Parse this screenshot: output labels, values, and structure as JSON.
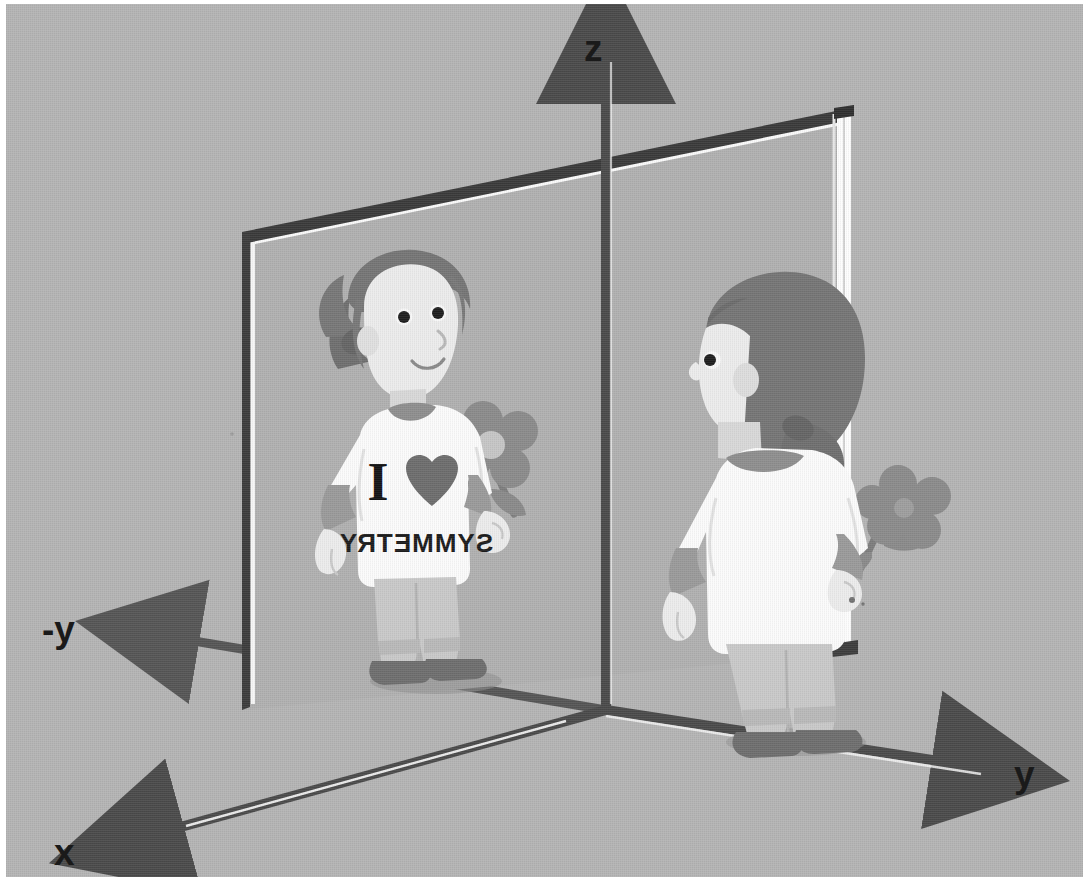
{
  "figure": {
    "background_color": "#b4b4b4",
    "border_color": "#ffffff"
  },
  "axes": {
    "color": "#4a4a4a",
    "labels": {
      "z": "z",
      "y": "y",
      "neg_y": "-y",
      "x": "x"
    },
    "label_color": "#1a1a1a"
  },
  "mirror": {
    "name": "reflection-plane",
    "frame_color": "#3c3c3c",
    "edge_highlight_color": "#fdfdfd",
    "surface_color": "#b0b0b0"
  },
  "mirror_image_figure": {
    "name": "reflected-girl",
    "shirt_text_line1": "I",
    "shirt_text_line2": "SYMMETRY",
    "shirt_heart": "heart",
    "shirt_color": "#fdfdfd",
    "hair_color": "#7a7a7a",
    "skin_color": "#e8e8e8",
    "pants_color": "#c9c9c9",
    "shoes_color": "#6e6e6e",
    "cuff_color": "#9a9a9a",
    "mirrored": "true",
    "holds": "flower"
  },
  "real_figure": {
    "name": "real-girl",
    "shirt_color": "#fdfdfd",
    "hair_color": "#7a7a7a",
    "skin_color": "#e8e8e8",
    "pants_color": "#c9c9c9",
    "shoes_color": "#6e6e6e",
    "cuff_color": "#9a9a9a",
    "view": "back-three-quarter",
    "holds": "flower"
  },
  "flower": {
    "name": "flower",
    "petal_color": "#858585",
    "center_color": "#cfcfcf",
    "stem_color": "#7d7d7d",
    "petals": 5
  }
}
